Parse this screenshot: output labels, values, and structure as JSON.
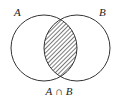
{
  "diagram": {
    "type": "venn",
    "sets": [
      {
        "name": "A",
        "label": "A",
        "cx": 44,
        "cy": 48,
        "r": 33
      },
      {
        "name": "B",
        "label": "B",
        "cx": 77,
        "cy": 48,
        "r": 33
      }
    ],
    "shaded_region": "intersection",
    "caption": {
      "left": "A",
      "operator": "∩",
      "right": "B"
    },
    "colors": {
      "stroke": "#333333",
      "hatch": "#333333",
      "background": "#ffffff"
    }
  }
}
